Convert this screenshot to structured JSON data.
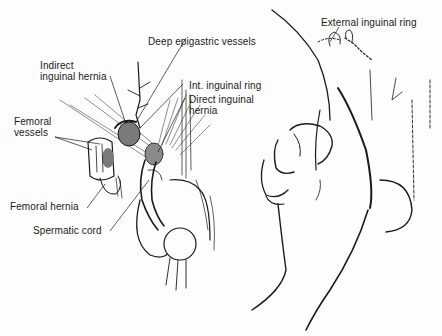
{
  "figure": {
    "left_panel": {
      "labels": {
        "deep_epigastric": "Deep epigastric vessels",
        "indirect_line1": "Indirect",
        "indirect_line2": "inguinal hernia",
        "int_ring": "Int. inguinal ring",
        "direct_line1": "Direct inguinal",
        "direct_line2": "hernia",
        "femoral_vessels_line1": "Femoral",
        "femoral_vessels_line2": "vessels",
        "femoral_hernia": "Femoral hernia",
        "spermatic_cord": "Spermatic cord"
      }
    },
    "right_panel": {
      "labels": {
        "external_ring": "External inguinal ring"
      }
    },
    "colors": {
      "ink": "#1a1a1a",
      "shade": "#7a7a7a",
      "paper": "#fdfdfd"
    }
  }
}
